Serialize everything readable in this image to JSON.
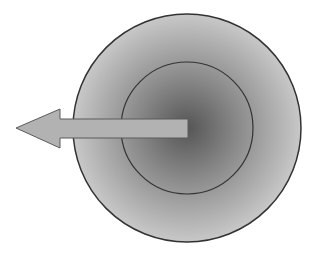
{
  "diagram": {
    "outer_circle": {
      "cx": 187,
      "cy": 128,
      "r": 114,
      "stroke": "#333333",
      "fill_light": "#c4c4c4",
      "fill_dark": "#8a8a8a"
    },
    "inner_circle": {
      "cx": 187,
      "cy": 128,
      "r": 66,
      "stroke": "#333333"
    },
    "arrow": {
      "direction": "left",
      "fill": "#b0b0b0",
      "stroke": "#555555",
      "tip_x": 16,
      "tail_x": 188,
      "y": 128
    },
    "gradient_center": "#5a5a5a",
    "background": "#ffffff"
  }
}
